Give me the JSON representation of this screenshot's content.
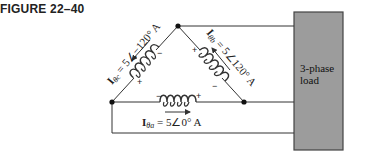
{
  "figure": {
    "label": "FIGURE 22–40"
  },
  "diagram": {
    "type": "delta-connected three-phase generator feeding load",
    "load": {
      "line1": "3-phase",
      "line2": "load",
      "fill_color": "#9c9c9c",
      "border_color": "#444444"
    },
    "phases": [
      {
        "id": "ac",
        "symbol": "I",
        "subscript": "θc",
        "rest": " = 5∠−120° A",
        "plus_label": "+",
        "minus_label": "−"
      },
      {
        "id": "ab",
        "symbol": "I",
        "subscript": "θb",
        "rest": " = 5∠120° A",
        "plus_label": "+",
        "minus_label": "−"
      },
      {
        "id": "ba",
        "symbol": "I",
        "subscript": "θa",
        "rest": " = 5∠0° A",
        "plus_label": "+",
        "minus_label": "−"
      }
    ],
    "line_color": "#333333"
  }
}
